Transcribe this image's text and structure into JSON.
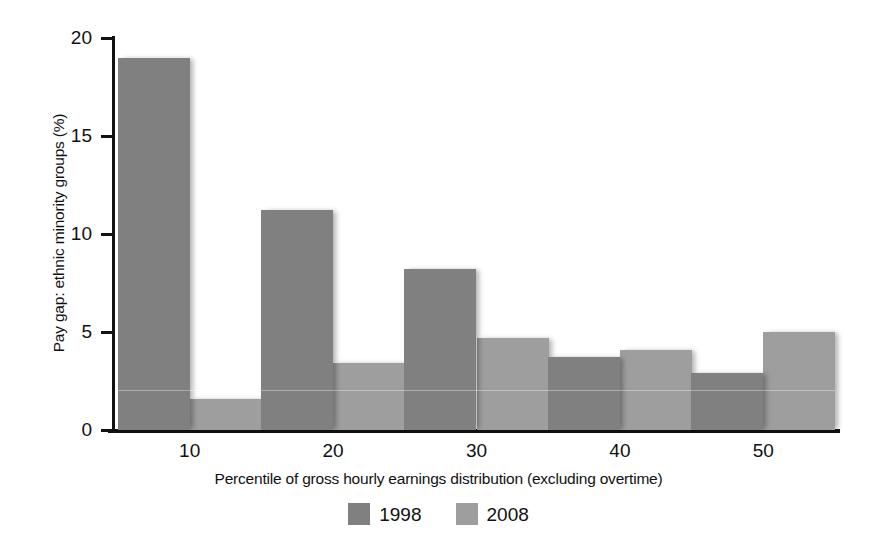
{
  "chart_data": {
    "type": "bar",
    "title": "",
    "xlabel": "Percentile of gross hourly earnings distribution (excluding overtime)",
    "ylabel": "Pay gap: ethnic minority groups (%)",
    "categories": [
      "10",
      "20",
      "30",
      "40",
      "50"
    ],
    "series": [
      {
        "name": "1998",
        "color": "#808080",
        "values": [
          19.0,
          11.2,
          8.2,
          3.7,
          2.9
        ]
      },
      {
        "name": "2008",
        "color": "#9e9e9e",
        "values": [
          1.6,
          3.4,
          4.7,
          4.1,
          5.0
        ]
      }
    ],
    "ylim": [
      0,
      20
    ],
    "yticks": [
      0,
      5,
      10,
      15,
      20
    ],
    "ytick_labels": [
      "0",
      "5",
      "10",
      "15",
      "20"
    ],
    "grid": false,
    "legend_position": "bottom-center"
  },
  "axes": {
    "y_title": "Pay gap: ethnic minority groups (%)",
    "x_title": "Percentile of gross hourly earnings distribution (excluding overtime)"
  },
  "legend": {
    "items": [
      {
        "label": "1998",
        "color": "#808080"
      },
      {
        "label": "2008",
        "color": "#9e9e9e"
      }
    ]
  }
}
